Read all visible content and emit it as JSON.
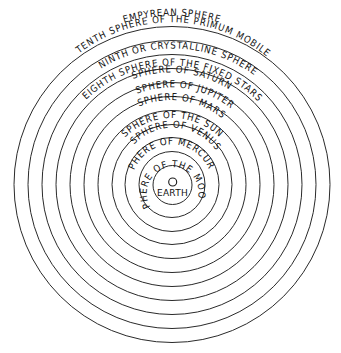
{
  "diagram": {
    "colors": {
      "background": "#ffffff",
      "lines": "#2a2a2a",
      "text": "#111111"
    },
    "center": "EARTH",
    "labels": {
      "empyrean": "EMPYREAN SPHERE",
      "tenth": "TENTH SPHERE OF THE PRIMUM MOBILE",
      "ninth": "NINTH OR CRYSTALLINE SPHERE",
      "eighth": "EIGHTH SPHERE OF THE FIXED STARS",
      "saturn": "SPHERE OF SATURN",
      "jupiter": "SPHERE OF JUPITER",
      "mars": "SPHERE OF MARS",
      "sun": "SPHERE OF THE SUN",
      "venus": "SPHERE OF VENUS",
      "mercury": "SPHERE OF MERCURY",
      "moon": "SPHERE OF THE MOON",
      "earth": "EARTH"
    },
    "spheres_outer_to_inner": [
      "EMPYREAN SPHERE",
      "TENTH SPHERE OF THE PRIMUM MOBILE",
      "NINTH OR CRYSTALLINE SPHERE",
      "EIGHTH SPHERE OF THE FIXED STARS",
      "SPHERE OF SATURN",
      "SPHERE OF JUPITER",
      "SPHERE OF MARS",
      "SPHERE OF THE SUN",
      "SPHERE OF VENUS",
      "SPHERE OF MERCURY",
      "SPHERE OF THE MOON",
      "EARTH"
    ]
  }
}
